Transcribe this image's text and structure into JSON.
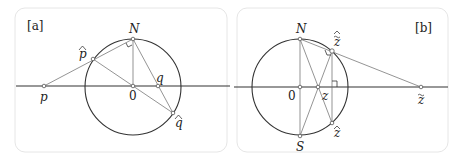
{
  "panels": [
    {
      "tag": "[a]",
      "labels": {
        "N": "N",
        "O": "0",
        "p": "p",
        "p_hat": "p",
        "q": "q",
        "q_hat": "q"
      }
    },
    {
      "tag": "[b]",
      "labels": {
        "N": "N",
        "S": "S",
        "O": "0",
        "z": "z",
        "z_hat_top": "z",
        "z_hat_bottom": "z",
        "z_tilde": "z"
      }
    }
  ],
  "colors": {
    "frame": "#e4e4e4",
    "line": "#333333",
    "thin": "#666666"
  }
}
